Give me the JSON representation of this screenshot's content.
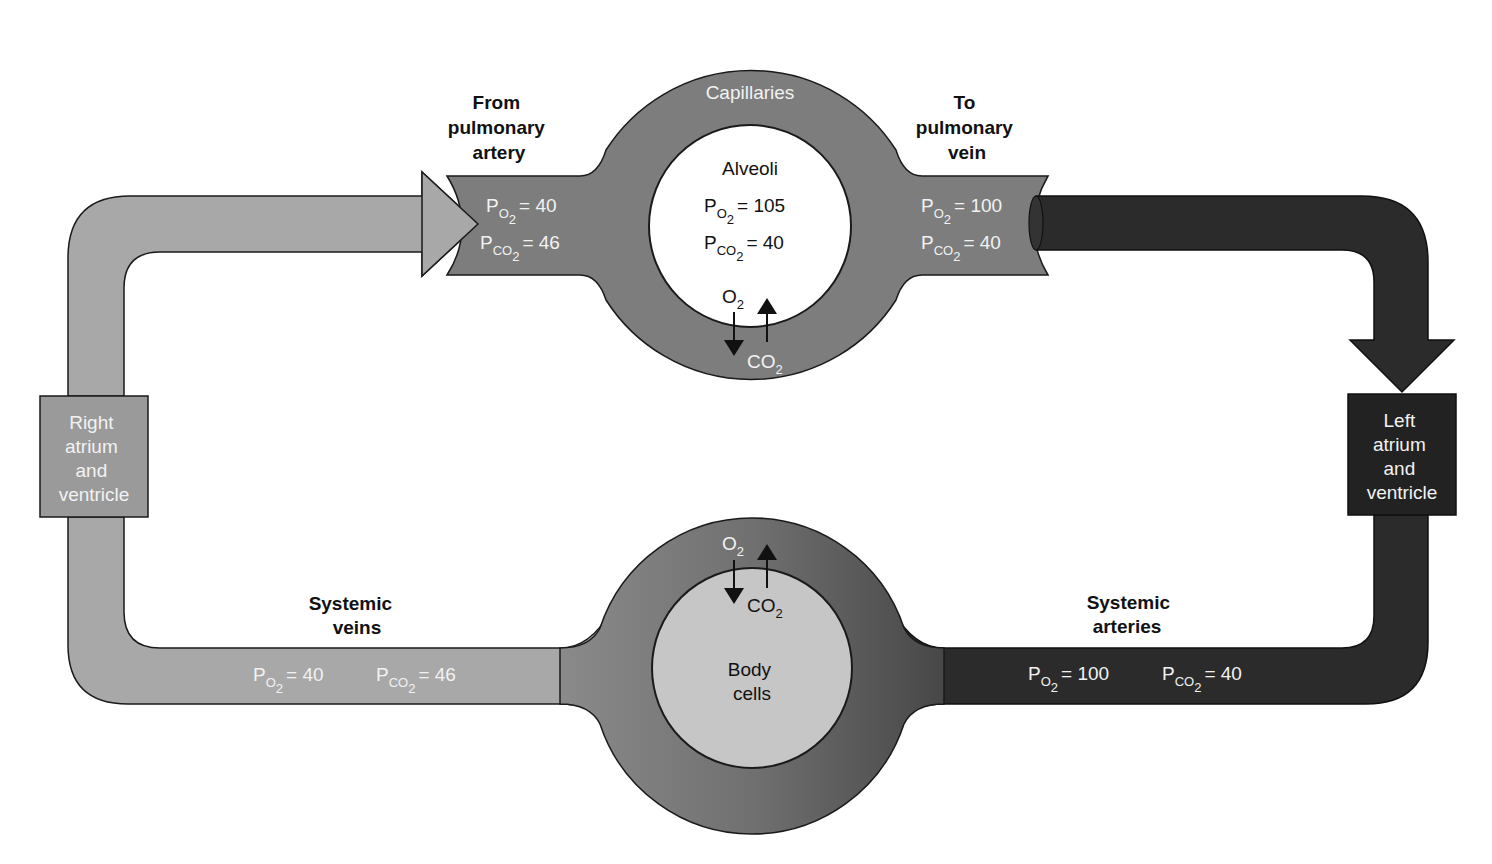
{
  "colors": {
    "deoxygenated": "#a8a8a8",
    "capillary": "#7d7d7d",
    "oxygenated": "#2b2b2b",
    "alveoli": "#ffffff",
    "body_cells": "#c6c6c6",
    "outline": "#1a1a1a",
    "label_on_dark": "#f2f2f2"
  },
  "pulmonary": {
    "from_label": [
      "From",
      "pulmonary",
      "artery"
    ],
    "to_label": [
      "To",
      "pulmonary",
      "vein"
    ],
    "capillaries_label": "Capillaries",
    "alveoli": {
      "label": "Alveoli",
      "po2": "= 105",
      "pco2": "= 40",
      "o2_arrow_label": "O",
      "co2_arrow_label": "CO"
    },
    "inflow": {
      "po2": "= 40",
      "pco2": "= 46"
    },
    "outflow": {
      "po2": "= 100",
      "pco2": "= 40"
    }
  },
  "heart": {
    "right": [
      "Right",
      "atrium",
      "and",
      "ventricle"
    ],
    "left": [
      "Left",
      "atrium",
      "and",
      "ventricle"
    ]
  },
  "systemic": {
    "veins_label": [
      "Systemic",
      "veins"
    ],
    "arteries_label": [
      "Systemic",
      "arteries"
    ],
    "veins": {
      "po2": "= 40",
      "pco2": "= 46"
    },
    "arteries": {
      "po2": "= 100",
      "pco2": "= 40"
    },
    "body_cells": {
      "label": [
        "Body",
        "cells"
      ],
      "o2_arrow_label": "O",
      "co2_arrow_label": "CO"
    }
  },
  "symbols": {
    "pressure": "P",
    "o2_sub": "O",
    "co2_sub": "CO",
    "two": "2"
  }
}
